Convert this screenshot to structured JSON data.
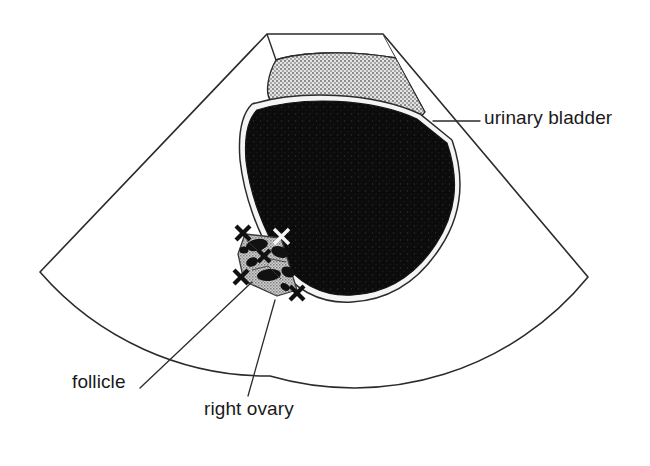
{
  "figure": {
    "title": "Transabdominal pelvic ultrasound scan diagram",
    "modality": "ultrasound",
    "view": "sector / fan-shaped field of view"
  },
  "labels": {
    "urinary_bladder": "urinary bladder",
    "follicle": "follicle",
    "right_ovary": "right ovary"
  },
  "colors": {
    "ink": "#1a1a1a",
    "outline": "#2b2b2b",
    "background": "#ffffff",
    "bladder_fill": "#0d0d0d",
    "bladder_halo": "#f2f2f2",
    "tissue_stipple_light": "#c9c9c9",
    "tissue_stipple_dark": "#8e8e8e",
    "ovary_fill": "#b3b3b3",
    "follicle_fill": "#111111",
    "caliper": "#111111"
  },
  "structures": [
    {
      "name": "sector-field-of-view",
      "kind": "outline",
      "note": "Fan / sector shaped scan field, apex at top centre, arc at bottom"
    },
    {
      "name": "abdominal-wall",
      "kind": "stippled-tissue",
      "note": "Grey speckled band across the near field just below the transducer apex"
    },
    {
      "name": "urinary-bladder",
      "kind": "anechoic-fluid",
      "note": "Large black (anechoic) rounded shape filling the centre of the sector"
    },
    {
      "name": "right-ovary",
      "kind": "stippled-tissue",
      "note": "Small grey speckled oval posterior-inferior to the bladder, outlined by calipers"
    },
    {
      "name": "follicles",
      "kind": "anechoic-cysts",
      "count": 7,
      "note": "Small black round/oval anechoic areas within the ovary"
    },
    {
      "name": "calipers",
      "kind": "measurement-markers",
      "count": 5,
      "note": "Cross (X) shaped electronic caliper marks around and within the ovary"
    }
  ],
  "leader_lines": [
    {
      "name": "urinary-bladder-leader",
      "from": "urinary bladder wall",
      "to": "urinary bladder label"
    },
    {
      "name": "follicle-leader",
      "from": "follicle within right ovary",
      "to": "follicle label"
    },
    {
      "name": "right-ovary-leader",
      "from": "right ovary",
      "to": "right ovary label"
    }
  ]
}
